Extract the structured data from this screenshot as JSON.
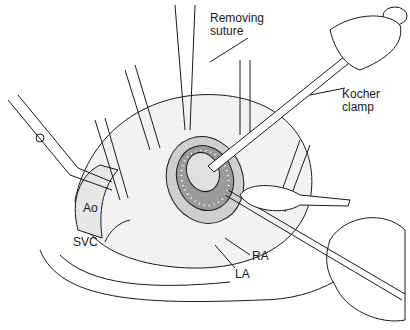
{
  "figure": {
    "type": "surgical-illustration",
    "labels": {
      "removing_suture": [
        "Removing",
        "suture"
      ],
      "kocher_clamp": [
        "Kocher",
        "clamp"
      ],
      "ao": "Ao",
      "svc": "SVC",
      "ra": "RA",
      "la": "LA"
    },
    "colors": {
      "line": "#1a1a1a",
      "shade": "#bdbdbd",
      "background": "#ffffff"
    }
  }
}
